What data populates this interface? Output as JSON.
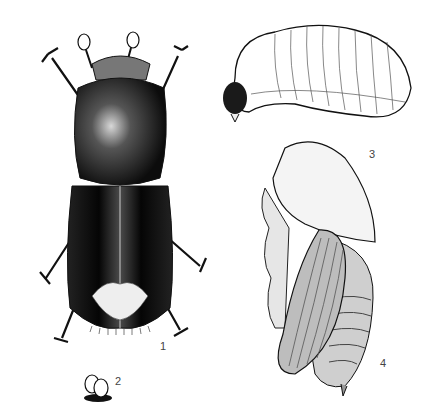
{
  "plate": {
    "background": "#ffffff",
    "ink": "#111111"
  },
  "figures": [
    {
      "id": "adult",
      "label": "1",
      "subject": "adult bark beetle, dorsal view"
    },
    {
      "id": "eggs",
      "label": "2",
      "subject": "eggs"
    },
    {
      "id": "larva",
      "label": "3",
      "subject": "larva, lateral view"
    },
    {
      "id": "pupa",
      "label": "4",
      "subject": "pupa, lateral view"
    }
  ]
}
